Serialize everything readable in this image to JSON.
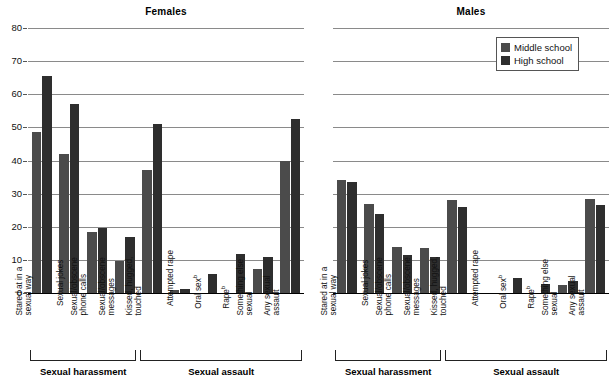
{
  "chart_data": {
    "type": "bar",
    "title": "",
    "xlabel": "",
    "ylabel": "",
    "ylim": [
      0,
      80
    ],
    "yticks": [
      0,
      10,
      20,
      30,
      40,
      50,
      60,
      70,
      80
    ],
    "grid": true,
    "legend_position": "top-right",
    "legend": [
      "Middle school",
      "High school"
    ],
    "colors": {
      "middle_school": "#4b4b4b",
      "high_school": "#2e2e2e"
    },
    "panels": [
      {
        "title": "Females",
        "categories": [
          "Stared at in a sexual way",
          "Sexual jokes",
          "Sexual/obscene phone calls",
          "Sexual/obscene messages",
          "Kissed, hugged, touched",
          "Attempted rape",
          "Oral sexᵇ",
          "Rapeᵇ",
          "Something else sexual",
          "Any sexual assault"
        ],
        "groups": [
          {
            "label": "Sexual harassment",
            "start": 0,
            "end": 3
          },
          {
            "label": "Sexual assault",
            "start": 4,
            "end": 9
          }
        ],
        "series": [
          {
            "name": "Middle school",
            "values": [
              48.5,
              42.0,
              18.5,
              9.7,
              37.2,
              0.8,
              0.0,
              0.0,
              7.2,
              40.0
            ]
          },
          {
            "name": "High school",
            "values": [
              65.5,
              57.0,
              19.5,
              17.0,
              51.0,
              1.1,
              5.6,
              11.9,
              11.0,
              52.5
            ]
          }
        ]
      },
      {
        "title": "Males",
        "categories": [
          "Stared at in a sexual way",
          "Sexual jokes",
          "Sexual/obscene phone calls",
          "Sexual/obscene messages",
          "Kissed, hugged, touched",
          "Attempted rape",
          "Oral sexᵇ",
          "Rapeᵇ",
          "Something else sexual",
          "Any sexual assault"
        ],
        "groups": [
          {
            "label": "Sexual harassment",
            "start": 0,
            "end": 3
          },
          {
            "label": "Sexual assault",
            "start": 4,
            "end": 9
          }
        ],
        "series": [
          {
            "name": "Middle school",
            "values": [
              34.0,
              27.0,
              14.0,
              13.6,
              28.0,
              0.0,
              0.0,
              0.0,
              2.4,
              28.5
            ]
          },
          {
            "name": "High school",
            "values": [
              33.5,
              24.0,
              11.5,
              11.0,
              26.0,
              0.0,
              4.4,
              2.7,
              3.6,
              26.5
            ]
          }
        ]
      }
    ],
    "category_lines": [
      [
        "Stared at in a",
        "sexual way"
      ],
      [
        "Sexual jokes"
      ],
      [
        "Sexual/obscene",
        "phone calls"
      ],
      [
        "Sexual/obscene",
        "messages"
      ],
      [
        "Kissed, hugged,",
        "touched"
      ],
      [
        "Attempted rape"
      ],
      [
        "Oral sexᵇ"
      ],
      [
        "Rapeᵇ"
      ],
      [
        "Something else",
        "sexual"
      ],
      [
        "Any sexual",
        "assault"
      ]
    ]
  }
}
